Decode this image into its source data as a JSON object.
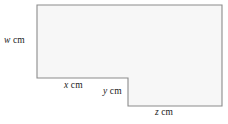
{
  "figure": {
    "type": "geometry-diagram",
    "shape_name": "l-shaped-polygon",
    "fill_color": "#f7f7f7",
    "stroke_color": "#8c8c8c",
    "background_color": "#ffffff",
    "outline_points": "37,5 222,5 222,106 128,106 128,78 37,78",
    "labels": {
      "w": {
        "var": "w",
        "unit": "cm",
        "side": "left"
      },
      "x": {
        "var": "x",
        "unit": "cm",
        "side": "bottom-left"
      },
      "y": {
        "var": "y",
        "unit": "cm",
        "side": "inner-right"
      },
      "z": {
        "var": "z",
        "unit": "cm",
        "side": "bottom-right"
      }
    }
  }
}
